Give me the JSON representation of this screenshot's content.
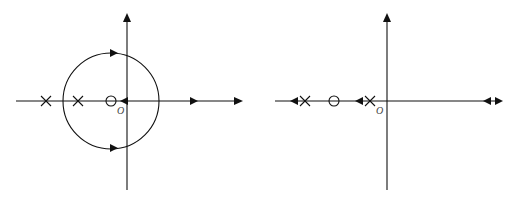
{
  "diagrams": [
    {
      "name": "root-locus-left",
      "origin_label": "O",
      "poles": [
        {
          "x": 46,
          "y": 101
        },
        {
          "x": 78,
          "y": 101
        }
      ],
      "zeros": [
        {
          "x": 111,
          "y": 101
        }
      ],
      "circle": {
        "cx": 111,
        "cy": 101,
        "r": 48
      },
      "axis_arrows": [
        {
          "x": 122,
          "dir": "left"
        },
        {
          "x": 195,
          "dir": "right"
        }
      ],
      "circle_arrows": [
        {
          "x": 113,
          "y": 53,
          "dir": "right"
        },
        {
          "x": 113,
          "y": 149,
          "dir": "right"
        }
      ]
    },
    {
      "name": "root-locus-right",
      "origin_label": "O",
      "poles": [
        {
          "x": 305,
          "y": 101
        },
        {
          "x": 370,
          "y": 101
        }
      ],
      "zeros": [
        {
          "x": 334,
          "y": 101
        }
      ],
      "axis_arrows": [
        {
          "x": 293,
          "dir": "left"
        },
        {
          "x": 358,
          "dir": "left"
        },
        {
          "x": 488,
          "dir": "left"
        },
        {
          "x": 500,
          "dir": "right"
        }
      ]
    }
  ],
  "colors": {
    "stroke": "#111111",
    "background": "#ffffff"
  }
}
